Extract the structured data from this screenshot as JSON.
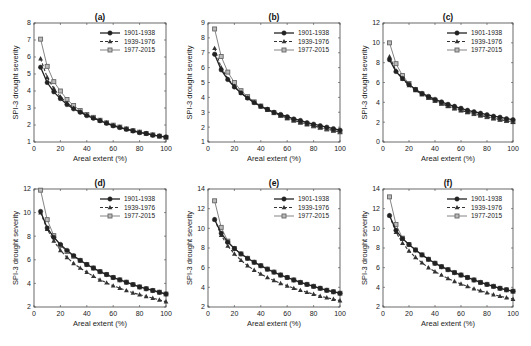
{
  "figure": {
    "series_styles": [
      {
        "name": "1901-1938",
        "color": "#222222",
        "width": 1.3,
        "dash": "",
        "marker": "circle"
      },
      {
        "name": "1939-1976",
        "color": "#333333",
        "width": 1.1,
        "dash": "3,2",
        "marker": "triangle"
      },
      {
        "name": "1977-2015",
        "color": "#666666",
        "width": 0.8,
        "dash": "",
        "marker": "square"
      }
    ]
  },
  "chart_data": [
    {
      "type": "line",
      "title": "(a)",
      "xlabel": "Areal extent (%)",
      "ylabel": "SPI-3 drought severity",
      "xlim": [
        0,
        100
      ],
      "ylim": [
        1,
        8
      ],
      "xticks": [
        0,
        20,
        40,
        60,
        80,
        100
      ],
      "yticks": [
        1,
        2,
        3,
        4,
        5,
        6,
        7,
        8
      ],
      "legend_position": "upper right",
      "grid": false,
      "x": [
        5,
        10,
        15,
        20,
        25,
        30,
        35,
        40,
        45,
        50,
        55,
        60,
        65,
        70,
        75,
        80,
        85,
        90,
        95,
        100
      ],
      "series": [
        {
          "name": "1901-1938",
          "values": [
            5.4,
            4.5,
            3.95,
            3.55,
            3.2,
            2.95,
            2.75,
            2.55,
            2.4,
            2.25,
            2.1,
            1.95,
            1.85,
            1.75,
            1.65,
            1.55,
            1.5,
            1.4,
            1.35,
            1.3
          ]
        },
        {
          "name": "1939-1976",
          "values": [
            5.9,
            4.8,
            4.15,
            3.65,
            3.3,
            3.0,
            2.78,
            2.58,
            2.42,
            2.27,
            2.12,
            1.98,
            1.87,
            1.77,
            1.67,
            1.58,
            1.5,
            1.42,
            1.35,
            1.28
          ]
        },
        {
          "name": "1977-2015",
          "values": [
            7.05,
            5.45,
            4.55,
            4.0,
            3.5,
            3.15,
            2.85,
            2.62,
            2.45,
            2.28,
            2.13,
            1.99,
            1.88,
            1.77,
            1.67,
            1.58,
            1.5,
            1.42,
            1.34,
            1.27
          ]
        }
      ]
    },
    {
      "type": "line",
      "title": "(b)",
      "xlabel": "Areal extent (%)",
      "ylabel": "SPI-3 drought severity",
      "xlim": [
        0,
        100
      ],
      "ylim": [
        1,
        9
      ],
      "xticks": [
        0,
        20,
        40,
        60,
        80,
        100
      ],
      "yticks": [
        1,
        2,
        3,
        4,
        5,
        6,
        7,
        8,
        9
      ],
      "legend_position": "upper right",
      "grid": false,
      "x": [
        5,
        10,
        15,
        20,
        25,
        30,
        35,
        40,
        45,
        50,
        55,
        60,
        65,
        70,
        75,
        80,
        85,
        90,
        95,
        100
      ],
      "series": [
        {
          "name": "1901-1938",
          "values": [
            6.9,
            5.85,
            5.2,
            4.7,
            4.3,
            3.95,
            3.65,
            3.4,
            3.2,
            3.0,
            2.85,
            2.7,
            2.55,
            2.45,
            2.3,
            2.2,
            2.1,
            2.0,
            1.9,
            1.8
          ]
        },
        {
          "name": "1939-1976",
          "values": [
            7.3,
            6.0,
            5.25,
            4.75,
            4.3,
            3.95,
            3.65,
            3.38,
            3.15,
            2.95,
            2.77,
            2.6,
            2.45,
            2.32,
            2.2,
            2.08,
            1.97,
            1.87,
            1.77,
            1.68
          ]
        },
        {
          "name": "1977-2015",
          "values": [
            8.6,
            6.75,
            5.7,
            5.0,
            4.45,
            4.05,
            3.7,
            3.42,
            3.18,
            2.97,
            2.78,
            2.61,
            2.46,
            2.32,
            2.2,
            2.08,
            1.97,
            1.87,
            1.77,
            1.68
          ]
        }
      ]
    },
    {
      "type": "line",
      "title": "(c)",
      "xlabel": "Areal extent (%)",
      "ylabel": "SPI-3 drought severity",
      "xlim": [
        0,
        100
      ],
      "ylim": [
        0,
        12
      ],
      "xticks": [
        0,
        20,
        40,
        60,
        80,
        100
      ],
      "yticks": [
        0,
        2,
        4,
        6,
        8,
        10,
        12
      ],
      "legend_position": "upper right",
      "grid": false,
      "x": [
        5,
        10,
        15,
        20,
        25,
        30,
        35,
        40,
        45,
        50,
        55,
        60,
        65,
        70,
        75,
        80,
        85,
        90,
        95,
        100
      ],
      "series": [
        {
          "name": "1901-1938",
          "values": [
            8.3,
            7.1,
            6.4,
            5.8,
            5.3,
            4.9,
            4.6,
            4.3,
            4.05,
            3.8,
            3.6,
            3.4,
            3.2,
            3.05,
            2.9,
            2.75,
            2.6,
            2.5,
            2.35,
            2.25
          ]
        },
        {
          "name": "1939-1976",
          "values": [
            8.6,
            7.2,
            6.35,
            5.7,
            5.2,
            4.8,
            4.45,
            4.15,
            3.85,
            3.6,
            3.38,
            3.18,
            3.0,
            2.83,
            2.67,
            2.52,
            2.38,
            2.25,
            2.13,
            2.0
          ]
        },
        {
          "name": "1977-2015",
          "values": [
            10.0,
            7.9,
            6.7,
            5.9,
            5.3,
            4.85,
            4.5,
            4.2,
            3.9,
            3.65,
            3.42,
            3.22,
            3.03,
            2.86,
            2.7,
            2.55,
            2.41,
            2.28,
            2.16,
            2.05
          ]
        }
      ]
    },
    {
      "type": "line",
      "title": "(d)",
      "xlabel": "Areal extent (%)",
      "ylabel": "SPI-3 drought severity",
      "xlim": [
        0,
        100
      ],
      "ylim": [
        2,
        12
      ],
      "xticks": [
        0,
        20,
        40,
        60,
        80,
        100
      ],
      "yticks": [
        2,
        4,
        6,
        8,
        10,
        12
      ],
      "legend_position": "upper right",
      "grid": false,
      "x": [
        5,
        10,
        15,
        20,
        25,
        30,
        35,
        40,
        45,
        50,
        55,
        60,
        65,
        70,
        75,
        80,
        85,
        90,
        95,
        100
      ],
      "series": [
        {
          "name": "1901-1938",
          "values": [
            10.1,
            8.7,
            7.9,
            7.3,
            6.8,
            6.35,
            5.95,
            5.6,
            5.3,
            5.0,
            4.75,
            4.5,
            4.3,
            4.1,
            3.9,
            3.7,
            3.55,
            3.4,
            3.25,
            3.1
          ]
        },
        {
          "name": "1939-1976",
          "values": [
            10.0,
            8.6,
            7.6,
            6.8,
            6.2,
            5.7,
            5.3,
            4.95,
            4.6,
            4.3,
            4.05,
            3.8,
            3.6,
            3.4,
            3.2,
            3.05,
            2.9,
            2.75,
            2.6,
            2.45
          ]
        },
        {
          "name": "1977-2015",
          "values": [
            11.9,
            9.4,
            8.05,
            7.2,
            6.7,
            6.3,
            5.95,
            5.6,
            5.3,
            5.0,
            4.75,
            4.5,
            4.3,
            4.1,
            3.9,
            3.7,
            3.55,
            3.4,
            3.25,
            3.1
          ]
        }
      ]
    },
    {
      "type": "line",
      "title": "(e)",
      "xlabel": "Areal extent (%)",
      "ylabel": "SPI-3 drought severity",
      "xlim": [
        0,
        100
      ],
      "ylim": [
        2,
        14
      ],
      "xticks": [
        0,
        20,
        40,
        60,
        80,
        100
      ],
      "yticks": [
        2,
        4,
        6,
        8,
        10,
        12,
        14
      ],
      "legend_position": "upper right",
      "grid": false,
      "x": [
        5,
        10,
        15,
        20,
        25,
        30,
        35,
        40,
        45,
        50,
        55,
        60,
        65,
        70,
        75,
        80,
        85,
        90,
        95,
        100
      ],
      "series": [
        {
          "name": "1901-1938",
          "values": [
            10.9,
            9.5,
            8.6,
            7.95,
            7.4,
            6.95,
            6.55,
            6.2,
            5.85,
            5.55,
            5.25,
            5.0,
            4.75,
            4.5,
            4.3,
            4.1,
            3.9,
            3.7,
            3.55,
            3.4
          ]
        },
        {
          "name": "1939-1976",
          "values": [
            10.9,
            9.3,
            8.2,
            7.4,
            6.75,
            6.2,
            5.75,
            5.35,
            5.0,
            4.7,
            4.4,
            4.15,
            3.9,
            3.7,
            3.5,
            3.3,
            3.1,
            2.95,
            2.8,
            2.65
          ]
        },
        {
          "name": "1977-2015",
          "values": [
            12.8,
            10.1,
            8.7,
            7.95,
            7.4,
            6.95,
            6.55,
            6.2,
            5.85,
            5.55,
            5.25,
            5.0,
            4.75,
            4.5,
            4.3,
            4.1,
            3.9,
            3.7,
            3.55,
            3.4
          ]
        }
      ]
    },
    {
      "type": "line",
      "title": "(f)",
      "xlabel": "Areal extent (%)",
      "ylabel": "SPI-3 drought severity",
      "xlim": [
        0,
        100
      ],
      "ylim": [
        2,
        14
      ],
      "xticks": [
        0,
        20,
        40,
        60,
        80,
        100
      ],
      "yticks": [
        2,
        4,
        6,
        8,
        10,
        12,
        14
      ],
      "legend_position": "upper right",
      "grid": false,
      "x": [
        5,
        10,
        15,
        20,
        25,
        30,
        35,
        40,
        45,
        50,
        55,
        60,
        65,
        70,
        75,
        80,
        85,
        90,
        95,
        100
      ],
      "series": [
        {
          "name": "1901-1938",
          "values": [
            11.3,
            9.8,
            8.95,
            8.35,
            7.8,
            7.3,
            6.85,
            6.45,
            6.1,
            5.8,
            5.5,
            5.25,
            5.0,
            4.75,
            4.5,
            4.3,
            4.1,
            3.9,
            3.75,
            3.6
          ]
        },
        {
          "name": "1939-1976",
          "values": [
            11.3,
            9.6,
            8.5,
            7.7,
            7.05,
            6.5,
            6.0,
            5.6,
            5.25,
            4.9,
            4.6,
            4.35,
            4.1,
            3.85,
            3.65,
            3.45,
            3.25,
            3.1,
            2.95,
            2.8
          ]
        },
        {
          "name": "1977-2015",
          "values": [
            13.2,
            10.4,
            9.0,
            8.35,
            7.8,
            7.3,
            6.85,
            6.45,
            6.1,
            5.8,
            5.5,
            5.25,
            5.0,
            4.75,
            4.5,
            4.3,
            4.1,
            3.9,
            3.75,
            3.6
          ]
        }
      ]
    }
  ]
}
